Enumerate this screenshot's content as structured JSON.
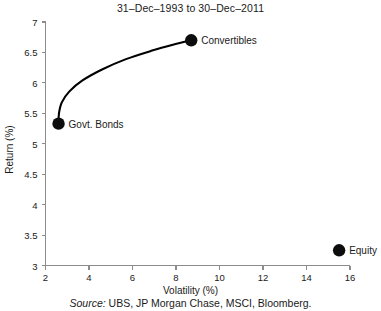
{
  "chart_data": {
    "type": "scatter",
    "title": "31–Dec–1993 to 30–Dec–2011",
    "xlabel": "Volatility (%)",
    "ylabel": "Return (%)",
    "xlim": [
      2,
      16
    ],
    "ylim": [
      3,
      7
    ],
    "xticks": [
      "2",
      "4",
      "6",
      "8",
      "10",
      "12",
      "14",
      "16"
    ],
    "xtick_values": [
      2,
      4,
      6,
      8,
      10,
      12,
      14,
      16
    ],
    "yticks": [
      "3",
      "3.5",
      "4",
      "4.5",
      "5",
      "5.5",
      "6",
      "6.5",
      "7"
    ],
    "ytick_values": [
      3,
      3.5,
      4,
      4.5,
      5,
      5.5,
      6,
      6.5,
      7
    ],
    "grid": false,
    "legend": "none",
    "points": [
      {
        "label": "Govt. Bonds",
        "x": 2.6,
        "y": 5.33
      },
      {
        "label": "Convertibles",
        "x": 8.7,
        "y": 6.7
      },
      {
        "label": "Equity",
        "x": 15.5,
        "y": 3.25
      }
    ],
    "series": [
      {
        "name": "efficient frontier",
        "type": "line",
        "x": [
          2.6,
          2.62,
          2.75,
          3.1,
          3.7,
          4.6,
          5.7,
          6.9,
          7.9,
          8.7
        ],
        "y": [
          5.33,
          5.5,
          5.68,
          5.86,
          6.04,
          6.22,
          6.39,
          6.53,
          6.63,
          6.7
        ]
      }
    ],
    "marker_color": "#0d0d0d",
    "line_color": "#000000",
    "axis_color": "#8c8c8c",
    "background_color": "#ffffff"
  },
  "footer": {
    "source_word": "Source:",
    "source_text": "UBS, JP Morgan Chase, MSCI, Bloomberg."
  }
}
